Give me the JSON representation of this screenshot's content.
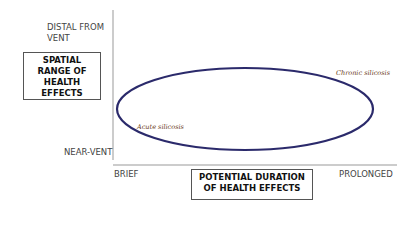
{
  "diagram": {
    "y_axis": {
      "title": "SPATIAL RANGE OF HEALTH EFFECTS",
      "title_lines": [
        "SPATIAL",
        "RANGE OF",
        "HEALTH",
        "EFFECTS"
      ],
      "top_label_lines": [
        "DISTAL FROM",
        "VENT"
      ],
      "bottom_label": "NEAR-VENT"
    },
    "x_axis": {
      "title_lines": [
        "POTENTIAL DURATION",
        "OF HEALTH EFFECTS"
      ],
      "left_label": "BRIEF",
      "right_label": "PROLONGED"
    },
    "region": {
      "shape": "ellipse",
      "stroke_color": "#2b2a6b",
      "annotations": {
        "lower_left": "Acute silicosis",
        "upper_right": "Chronic silicosis"
      }
    }
  }
}
